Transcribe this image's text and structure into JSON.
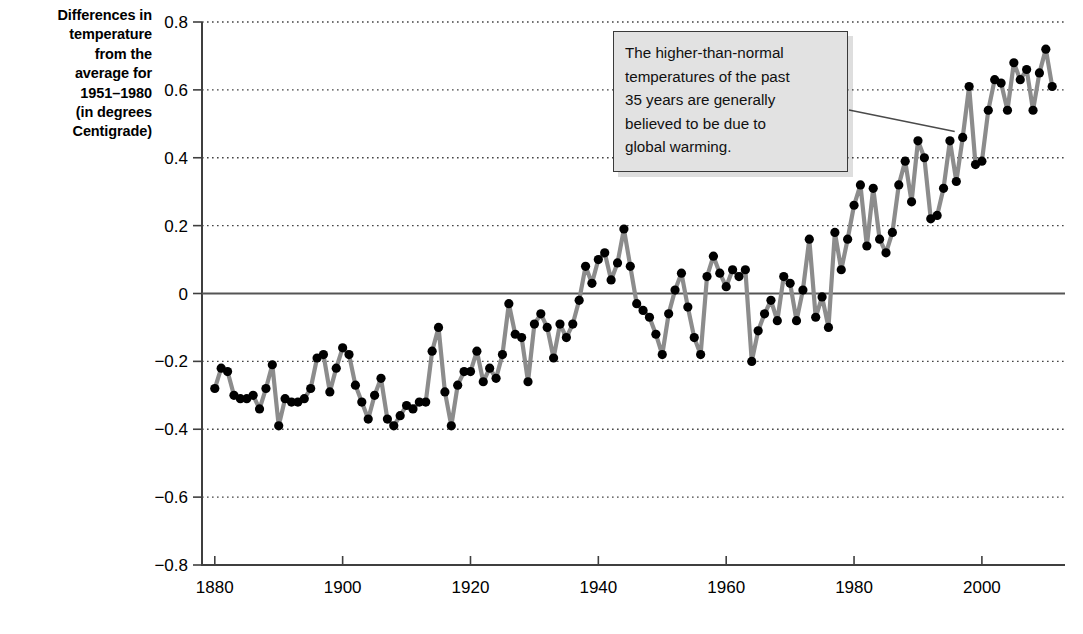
{
  "chart_data": {
    "type": "line",
    "title": "",
    "xlabel": "",
    "ylabel": "Differences in temperature from the average for 1951–1980 (in degrees Centigrade)",
    "ylabel_lines": [
      "Differences in",
      "temperature",
      "from the",
      "average for",
      "1951–1980",
      "(in degrees",
      "Centigrade)"
    ],
    "xlim": [
      1878,
      2013
    ],
    "ylim": [
      -0.8,
      0.8
    ],
    "y_ticks": [
      0.8,
      0.6,
      0.4,
      0.2,
      0,
      -0.2,
      -0.4,
      -0.6,
      -0.8
    ],
    "y_tick_labels": [
      "0.8",
      "0.6",
      "0.4",
      "0.2",
      "0",
      "−0.2",
      "−0.4",
      "−0.6",
      "−0.8"
    ],
    "x_ticks": [
      1880,
      1900,
      1920,
      1940,
      1960,
      1980,
      2000
    ],
    "x_tick_labels": [
      "1880",
      "1900",
      "1920",
      "1940",
      "1960",
      "1980",
      "2000"
    ],
    "grid": "horizontal-dotted",
    "zero_line": true,
    "legend": "none",
    "series": [
      {
        "name": "Global mean temperature anomaly",
        "marker": "filled-circle",
        "line_color": "#8c8c8c",
        "marker_color": "#000000",
        "x": [
          1880,
          1881,
          1882,
          1883,
          1884,
          1885,
          1886,
          1887,
          1888,
          1889,
          1890,
          1891,
          1892,
          1893,
          1894,
          1895,
          1896,
          1897,
          1898,
          1899,
          1900,
          1901,
          1902,
          1903,
          1904,
          1905,
          1906,
          1907,
          1908,
          1909,
          1910,
          1911,
          1912,
          1913,
          1914,
          1915,
          1916,
          1917,
          1918,
          1919,
          1920,
          1921,
          1922,
          1923,
          1924,
          1925,
          1926,
          1927,
          1928,
          1929,
          1930,
          1931,
          1932,
          1933,
          1934,
          1935,
          1936,
          1937,
          1938,
          1939,
          1940,
          1941,
          1942,
          1943,
          1944,
          1945,
          1946,
          1947,
          1948,
          1949,
          1950,
          1951,
          1952,
          1953,
          1954,
          1955,
          1956,
          1957,
          1958,
          1959,
          1960,
          1961,
          1962,
          1963,
          1964,
          1965,
          1966,
          1967,
          1968,
          1969,
          1970,
          1971,
          1972,
          1973,
          1974,
          1975,
          1976,
          1977,
          1978,
          1979,
          1980,
          1981,
          1982,
          1983,
          1984,
          1985,
          1986,
          1987,
          1988,
          1989,
          1990,
          1991,
          1992,
          1993,
          1994,
          1995,
          1996,
          1997,
          1998,
          1999,
          2000,
          2001,
          2002,
          2003,
          2004,
          2005,
          2006,
          2007,
          2008,
          2009,
          2010,
          2011
        ],
        "values": [
          -0.28,
          -0.22,
          -0.23,
          -0.3,
          -0.31,
          -0.31,
          -0.3,
          -0.34,
          -0.28,
          -0.21,
          -0.39,
          -0.31,
          -0.32,
          -0.32,
          -0.31,
          -0.28,
          -0.19,
          -0.18,
          -0.29,
          -0.22,
          -0.16,
          -0.18,
          -0.27,
          -0.32,
          -0.37,
          -0.3,
          -0.25,
          -0.37,
          -0.39,
          -0.36,
          -0.33,
          -0.34,
          -0.32,
          -0.32,
          -0.17,
          -0.1,
          -0.29,
          -0.39,
          -0.27,
          -0.23,
          -0.23,
          -0.17,
          -0.26,
          -0.22,
          -0.25,
          -0.18,
          -0.03,
          -0.12,
          -0.13,
          -0.26,
          -0.09,
          -0.06,
          -0.1,
          -0.19,
          -0.09,
          -0.13,
          -0.09,
          -0.02,
          0.08,
          0.03,
          0.1,
          0.12,
          0.04,
          0.09,
          0.19,
          0.08,
          -0.03,
          -0.05,
          -0.07,
          -0.12,
          -0.18,
          -0.06,
          0.01,
          0.06,
          -0.04,
          -0.13,
          -0.18,
          0.05,
          0.11,
          0.06,
          0.02,
          0.07,
          0.05,
          0.07,
          -0.2,
          -0.11,
          -0.06,
          -0.02,
          -0.08,
          0.05,
          0.03,
          -0.08,
          0.01,
          0.16,
          -0.07,
          -0.01,
          -0.1,
          0.18,
          0.07,
          0.16,
          0.26,
          0.32,
          0.14,
          0.31,
          0.16,
          0.12,
          0.18,
          0.32,
          0.39,
          0.27,
          0.45,
          0.4,
          0.22,
          0.23,
          0.31,
          0.45,
          0.33,
          0.46,
          0.61,
          0.38,
          0.39,
          0.54,
          0.63,
          0.62,
          0.54,
          0.68,
          0.63,
          0.66,
          0.54,
          0.65,
          0.72,
          0.61
        ],
        "value_units": "degrees Centigrade"
      }
    ],
    "annotations": [
      {
        "text": "The higher-than-normal temperatures of the past 35 years are generally believed to be due to global warming.",
        "lines": [
          "The higher-than-normal",
          "temperatures of the past",
          "35 years are generally",
          "believed to be due to",
          "global warming."
        ],
        "has_leader_line": true,
        "points_to_year": 1997
      }
    ],
    "colors": {
      "line": "#8c8c8c",
      "marker": "#000000",
      "axis": "#3f3f3f",
      "grid": "#444444",
      "annotation_bg": "#e2e2e2",
      "annotation_border": "#3a3a3a",
      "text": "#000000"
    }
  }
}
